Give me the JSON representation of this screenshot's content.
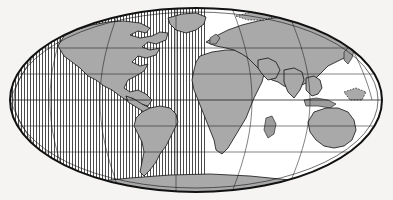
{
  "figure": {
    "kind": "world-map",
    "projection_name": "Mollweide",
    "title": "",
    "caption": "",
    "background_color": "#f5f4f2"
  },
  "style": {
    "land_fill": "#a9a9a9",
    "ocean_fill": "#ffffff",
    "outline_color": "#111111",
    "graticule_color": "#1a1a1a",
    "hatch_color": "#3a3a3a"
  },
  "map_extent": {
    "center_x": 196,
    "center_y": 100,
    "semi_axis_x": 188,
    "semi_axis_y": 94
  },
  "graticule": {
    "parallels_deg": [
      60,
      30,
      0,
      -30,
      -60
    ],
    "meridians_deg": [
      -180,
      -120,
      -60,
      0,
      60,
      120,
      180
    ],
    "equator_deg": 0,
    "central_meridian_deg": 10
  },
  "shaded_region": {
    "name": "western-hemisphere-hatching",
    "pattern": "vertical-lines",
    "spacing_px": 3,
    "x_start": 8,
    "x_end": 205
  },
  "landmasses": [
    {
      "name": "north-america",
      "filled": true
    },
    {
      "name": "south-america",
      "filled": true
    },
    {
      "name": "greenland",
      "filled": true
    },
    {
      "name": "africa",
      "filled": true
    },
    {
      "name": "eurasia",
      "filled": true
    },
    {
      "name": "australia",
      "filled": true
    },
    {
      "name": "antarctica",
      "filled": true
    },
    {
      "name": "indonesia-archipelago",
      "filled": true
    },
    {
      "name": "japan",
      "filled": true
    },
    {
      "name": "madagascar",
      "filled": true
    },
    {
      "name": "new-zealand",
      "filled": true
    },
    {
      "name": "british-isles",
      "filled": true
    }
  ]
}
